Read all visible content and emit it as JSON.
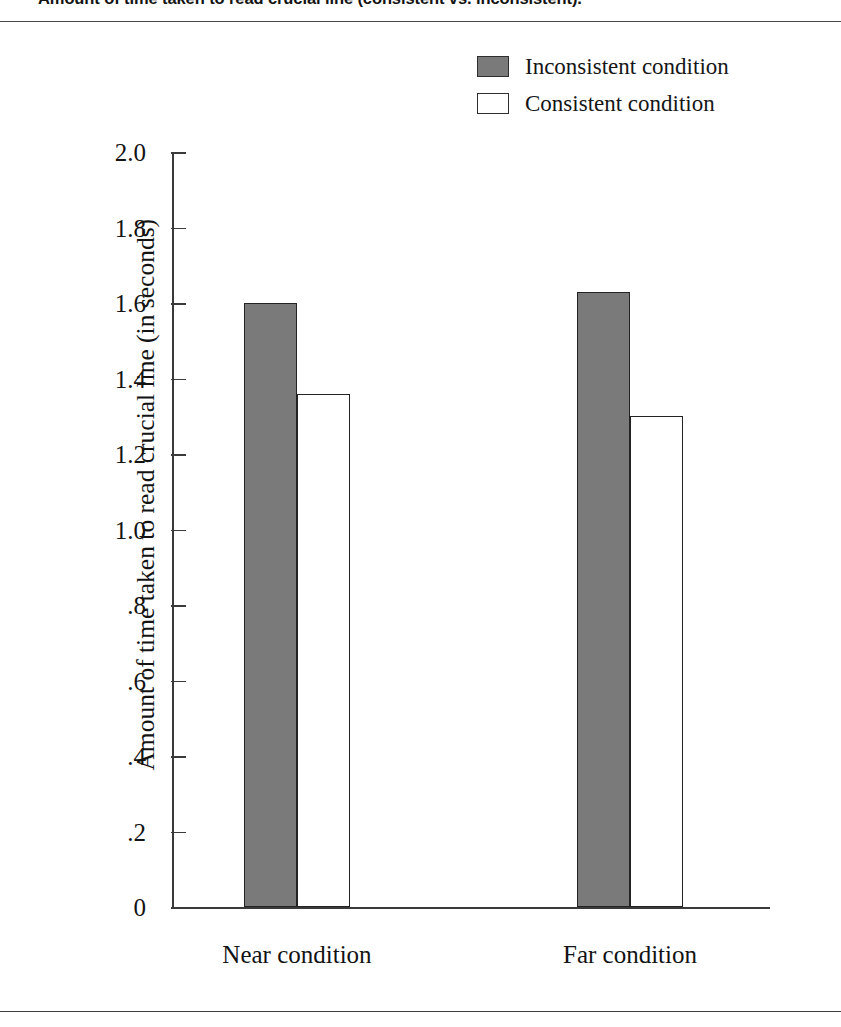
{
  "figure": {
    "caption": "Amount of time taken to read crucial line (consistent vs. inconsistent)."
  },
  "chart_data": {
    "type": "bar",
    "title": "Amount of time taken to read crucial line (consistent vs. inconsistent).",
    "xlabel": "",
    "ylabel": "Amount of time taken to read crucial line (in seconds)",
    "categories": [
      "Near condition",
      "Far condition"
    ],
    "series": [
      {
        "name": "Inconsistent condition",
        "color": "#7a7a7a",
        "values": [
          1.6,
          1.63
        ]
      },
      {
        "name": "Consistent condition",
        "color": "#ffffff",
        "values": [
          1.36,
          1.3
        ]
      }
    ],
    "ylim": [
      0,
      2.0
    ],
    "ytick_values": [
      2.0,
      1.8,
      1.6,
      1.4,
      1.2,
      1.0,
      0.8,
      0.6,
      0.4,
      0.2,
      0
    ],
    "ytick_labels": [
      "2.0",
      "1.8",
      "1.6",
      "1.4",
      "1.2",
      "1.0",
      ".8",
      ".6",
      ".4",
      ".2",
      "0"
    ],
    "grid": false,
    "legend_position": "top-right"
  },
  "legend": {
    "entries": [
      {
        "label": "Inconsistent condition",
        "swatch": "filled"
      },
      {
        "label": "Consistent condition",
        "swatch": "hollow"
      }
    ]
  }
}
